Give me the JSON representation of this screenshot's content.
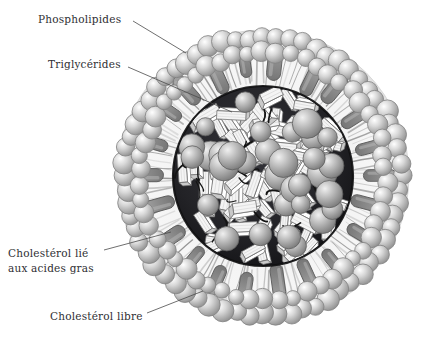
{
  "figure": {
    "background_color": "#ffffff",
    "width": 447,
    "height": 344
  },
  "labels": [
    {
      "id": "phospholipides",
      "text": "Phospholipides",
      "x": 38,
      "y": 12,
      "leader": {
        "x1": 133,
        "y1": 21,
        "x2": 186,
        "y2": 53
      }
    },
    {
      "id": "triglycerides",
      "text": "Triglycérides",
      "x": 48,
      "y": 57,
      "leader": {
        "x1": 128,
        "y1": 67,
        "x2": 232,
        "y2": 112
      }
    },
    {
      "id": "cholesterol-lie",
      "text_line1": "Cholestérol lié",
      "text_line2": "aux acides gras",
      "x": 8,
      "y": 246,
      "leader": {
        "x1": 104,
        "y1": 250,
        "x2": 171,
        "y2": 232
      }
    },
    {
      "id": "cholesterol-libre",
      "text": "Cholestérol libre",
      "x": 50,
      "y": 309,
      "leader": {
        "x1": 147,
        "y1": 313,
        "x2": 203,
        "y2": 291
      }
    }
  ],
  "particle": {
    "center_x": 263,
    "center_y": 176,
    "outer_radius": 146,
    "head_ring_radius": 132,
    "tail_inner_radius": 92,
    "core_radius": 90,
    "core_color": "#26262a",
    "shell_color": "#f2f2f2",
    "head_color": "#b9b9b9",
    "head_highlight": "#efefef",
    "slab_color": "#8d8d8d",
    "slab_outline": "#5c5c5c",
    "tail_color": "#9b9b9b",
    "outline_color": "#6a6a6a"
  },
  "components": {
    "phospholipid_head_count": 64,
    "phospholipid_tail_count": 128,
    "cholesterol_slab_count": 22,
    "core_sphere_count": 34,
    "core_rod_count": 80,
    "core_strand_count": 26,
    "core_sphere_color": "#a8a8a8",
    "core_rod_color": "#f4f4f4",
    "core_rod_shade": "#c9c9c9",
    "core_strand_color": "#141414"
  },
  "legend_semantics": {
    "phospholipides": "outer monolayer head groups and tails",
    "triglycerides": "light rod-shaped molecules in hydrophobic core",
    "cholesterol_lie_aux_acides_gras": "cholesteryl esters, gray spheres in core",
    "cholesterol_libre": "free cholesterol, gray slabs within the monolayer"
  }
}
